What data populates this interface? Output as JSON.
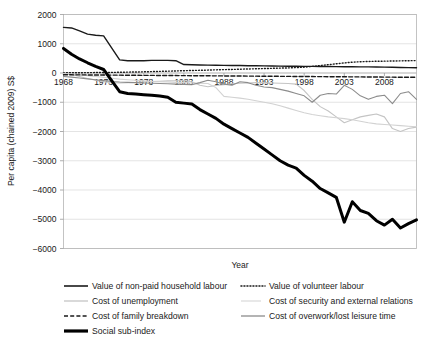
{
  "title_partial": "",
  "axes": {
    "ylabel": "Per capita (chained 2009) S$",
    "xlabel": "Year",
    "yticks": [
      "2000",
      "1000",
      "0",
      "-1000",
      "-2000",
      "-3000",
      "-4000",
      "-5000",
      "-6000"
    ],
    "xticks": [
      "1968",
      "1973",
      "1978",
      "1983",
      "1988",
      "1993",
      "1998",
      "2003",
      "2008"
    ]
  },
  "legend": {
    "items": [
      {
        "label": "Value of non-paid household labour",
        "key": "solid-thin-black",
        "color": "#1a1a1a"
      },
      {
        "label": "Value of volunteer labour",
        "key": "dotted-black",
        "color": "#1a1a1a"
      },
      {
        "label": "Cost of unemployment",
        "key": "solid-light-grey",
        "color": "#c4c4c4"
      },
      {
        "label": "Cost of security and external relations",
        "key": "solid-lighter-grey",
        "color": "#d2d2d2"
      },
      {
        "label": "Cost of family breakdown",
        "key": "dashed-black",
        "color": "#1a1a1a"
      },
      {
        "label": "Cost of overwork/lost leisure time",
        "key": "solid-mid-grey",
        "color": "#8c8c8c"
      },
      {
        "label": "Social sub-index",
        "key": "solid-thick-black",
        "color": "#000000"
      }
    ]
  },
  "chart_data": {
    "type": "line",
    "title": "",
    "xlabel": "Year",
    "ylabel": "Per capita (chained 2009) S$",
    "xlim": [
      1968,
      2012
    ],
    "ylim": [
      -6000,
      2000
    ],
    "grid": true,
    "legend_position": "bottom",
    "x": [
      1968,
      1969,
      1970,
      1971,
      1972,
      1973,
      1974,
      1975,
      1976,
      1977,
      1978,
      1979,
      1980,
      1981,
      1982,
      1983,
      1984,
      1985,
      1986,
      1987,
      1988,
      1989,
      1990,
      1991,
      1992,
      1993,
      1994,
      1995,
      1996,
      1997,
      1998,
      1999,
      2000,
      2001,
      2002,
      2003,
      2004,
      2005,
      2006,
      2007,
      2008,
      2009,
      2010,
      2011,
      2012
    ],
    "series": [
      {
        "name": "Value of non-paid household labour",
        "style": "solid-thin-black",
        "color": "#1a1a1a",
        "width": 1.4,
        "values": [
          1560,
          1540,
          1440,
          1330,
          1290,
          1270,
          860,
          450,
          420,
          420,
          420,
          430,
          430,
          430,
          420,
          290,
          280,
          275,
          270,
          265,
          260,
          255,
          255,
          250,
          250,
          245,
          240,
          235,
          230,
          230,
          228,
          225,
          222,
          220,
          218,
          215,
          212,
          210,
          208,
          205,
          200,
          195,
          190,
          185,
          180
        ]
      },
      {
        "name": "Value of volunteer labour",
        "style": "dotted-black",
        "color": "#1a1a1a",
        "width": 1.4,
        "values": [
          5,
          8,
          10,
          12,
          15,
          18,
          20,
          25,
          30,
          35,
          40,
          48,
          55,
          62,
          70,
          78,
          85,
          92,
          100,
          108,
          115,
          122,
          130,
          138,
          145,
          152,
          160,
          168,
          175,
          185,
          200,
          225,
          255,
          285,
          315,
          345,
          370,
          385,
          395,
          400,
          405,
          410,
          415,
          420,
          425
        ]
      },
      {
        "name": "Cost of unemployment",
        "style": "solid-light-grey",
        "color": "#c4c4c4",
        "width": 1.1,
        "values": [
          -30,
          -60,
          -120,
          -190,
          -250,
          -300,
          -330,
          -340,
          -330,
          -320,
          -300,
          -290,
          -280,
          -270,
          -265,
          -260,
          -300,
          -420,
          -470,
          -430,
          -400,
          -370,
          -350,
          -340,
          -330,
          -330,
          -340,
          -350,
          -360,
          -380,
          -600,
          -900,
          -1150,
          -1300,
          -1500,
          -1700,
          -1600,
          -1500,
          -1450,
          -1400,
          -1500,
          -1900,
          -2000,
          -1900,
          -1850
        ]
      },
      {
        "name": "Cost of security and external relations",
        "style": "solid-lighter-grey",
        "color": "#d2d2d2",
        "width": 1.1,
        "values": [
          -20,
          -35,
          -60,
          -90,
          -120,
          -150,
          -180,
          -210,
          -230,
          -250,
          -270,
          -290,
          -300,
          -310,
          -320,
          -330,
          -340,
          -350,
          -360,
          -500,
          -800,
          -830,
          -860,
          -900,
          -950,
          -1000,
          -1050,
          -1120,
          -1200,
          -1280,
          -1360,
          -1420,
          -1460,
          -1500,
          -1530,
          -1560,
          -1600,
          -1650,
          -1700,
          -1740,
          -1760,
          -1780,
          -1800,
          -1820,
          -1840
        ]
      },
      {
        "name": "Cost of family breakdown",
        "style": "dashed-black",
        "color": "#1a1a1a",
        "width": 1.4,
        "values": [
          -60,
          -62,
          -64,
          -66,
          -68,
          -70,
          -72,
          -74,
          -76,
          -78,
          -80,
          -82,
          -84,
          -86,
          -88,
          -90,
          -92,
          -94,
          -96,
          -98,
          -100,
          -102,
          -104,
          -106,
          -108,
          -110,
          -112,
          -114,
          -116,
          -118,
          -120,
          -122,
          -124,
          -126,
          -128,
          -130,
          -132,
          -134,
          -136,
          -138,
          -140,
          -142,
          -144,
          -146,
          -148
        ]
      },
      {
        "name": "Cost of overwork/lost leisure time",
        "style": "solid-mid-grey",
        "color": "#8c8c8c",
        "width": 1.1,
        "values": [
          -120,
          -140,
          -170,
          -200,
          -230,
          -260,
          -290,
          -310,
          -320,
          -330,
          -340,
          -350,
          -360,
          -370,
          -380,
          -390,
          -400,
          -330,
          -250,
          -300,
          -380,
          -420,
          -300,
          -330,
          -420,
          -480,
          -500,
          -560,
          -620,
          -700,
          -780,
          -1000,
          -760,
          -700,
          -720,
          -420,
          -560,
          -780,
          -900,
          -800,
          -760,
          -1050,
          -700,
          -640,
          -900
        ]
      },
      {
        "name": "Social sub-index",
        "style": "solid-thick-black",
        "color": "#000000",
        "width": 3.0,
        "values": [
          840,
          640,
          480,
          350,
          230,
          120,
          -260,
          -640,
          -700,
          -720,
          -740,
          -760,
          -790,
          -830,
          -1000,
          -1030,
          -1060,
          -1250,
          -1400,
          -1550,
          -1750,
          -1900,
          -2050,
          -2200,
          -2400,
          -2600,
          -2800,
          -3000,
          -3150,
          -3250,
          -3500,
          -3700,
          -3950,
          -4100,
          -4250,
          -5100,
          -4400,
          -4700,
          -4800,
          -5050,
          -5200,
          -5000,
          -5300,
          -5150,
          -5020
        ]
      }
    ]
  }
}
